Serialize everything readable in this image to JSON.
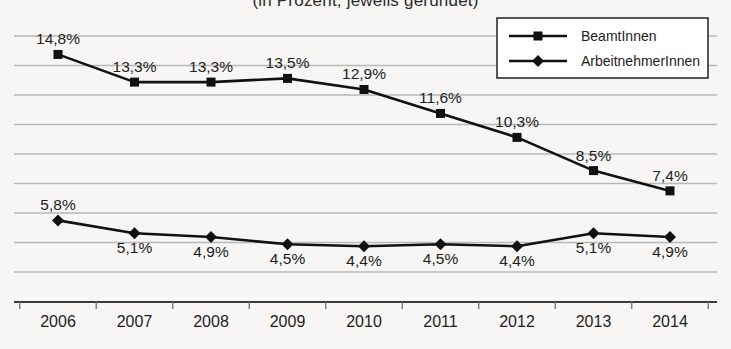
{
  "chart_data": {
    "type": "line",
    "title": "(in Prozent, jeweils gerundet)",
    "xlabel": "",
    "ylabel": "",
    "categories": [
      "2006",
      "2007",
      "2008",
      "2009",
      "2010",
      "2011",
      "2012",
      "2013",
      "2014"
    ],
    "series": [
      {
        "name": "ArbeitnehmerInnen",
        "marker": "diamond",
        "color": "#111111",
        "values": [
          5.8,
          5.1,
          4.9,
          4.5,
          4.4,
          4.5,
          4.4,
          5.1,
          4.9
        ],
        "labels": [
          "5,8%",
          "5,1%",
          "4,9%",
          "4,5%",
          "4,4%",
          "4,5%",
          "4,4%",
          "5,1%",
          "4,9%"
        ],
        "label_position": [
          "above",
          "below",
          "below",
          "below",
          "below",
          "below",
          "below",
          "below",
          "below"
        ]
      },
      {
        "name": "BeamtInnen",
        "marker": "square",
        "color": "#111111",
        "values": [
          14.8,
          13.3,
          13.3,
          13.5,
          12.9,
          11.6,
          10.3,
          8.5,
          7.4
        ],
        "labels": [
          "14,8%",
          "13,3%",
          "13,3%",
          "13,5%",
          "12,9%",
          "11,6%",
          "10,3%",
          "8,5%",
          "7,4%"
        ],
        "label_position": [
          "above",
          "above",
          "above",
          "above",
          "above",
          "above",
          "above",
          "above",
          "above"
        ]
      }
    ],
    "ylim": [
      3.0,
      15.8
    ],
    "grid": true,
    "gridlines": 9,
    "legend_position": "top-right",
    "axis": {
      "x_axis_line": true,
      "y_axis_line": false,
      "tick_marks": true
    }
  }
}
